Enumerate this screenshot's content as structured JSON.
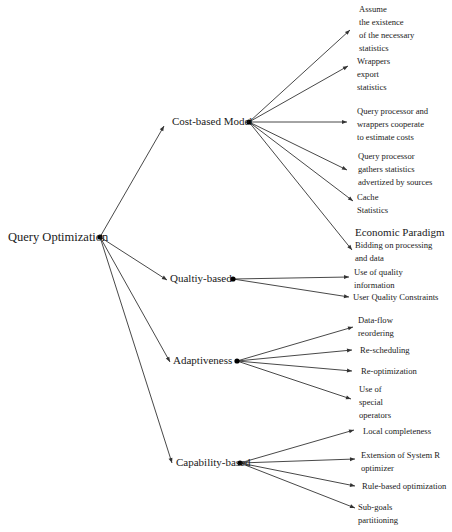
{
  "diagram": {
    "type": "tree",
    "root": {
      "label": "Query Optimization",
      "dot": [
        100,
        237
      ],
      "label_pos": [
        8,
        231
      ]
    },
    "branches": [
      {
        "id": "cost",
        "label": "Cost-based Model",
        "label_pos": [
          172,
          116
        ],
        "arrow_end": [
          164,
          126
        ],
        "dot": [
          249,
          122
        ],
        "leaves": [
          {
            "lines": [
              "Assume",
              "the existence",
              "of the necessary",
              "statistics"
            ],
            "pos": [
              359,
              3
            ],
            "arrow_end": [
              350,
              30
            ]
          },
          {
            "lines": [
              "Wrappers",
              "export",
              "statistics"
            ],
            "pos": [
              357,
              55
            ],
            "arrow_end": [
              348,
              66
            ]
          },
          {
            "lines": [
              "Query processor and",
              "wrappers cooperate",
              "to estimate costs"
            ],
            "pos": [
              357,
              105
            ],
            "arrow_end": [
              347,
              122
            ]
          },
          {
            "lines": [
              "Query processor",
              "gathers statistics",
              "advertized by sources"
            ],
            "pos": [
              358,
              150
            ],
            "arrow_end": [
              347,
              170
            ]
          },
          {
            "lines": [
              "Cache",
              "Statistics"
            ],
            "pos": [
              357,
              191
            ],
            "arrow_end": [
              353,
              201
            ]
          },
          {
            "lines": [
              "Economic Paradigm",
              "Bidding on  processing",
              "and data"
            ],
            "pos": [
              355,
              226
            ],
            "arrow_end": [
              352,
              250
            ],
            "emphasis_first_line": true
          }
        ]
      },
      {
        "id": "quality",
        "label": "Qualtiy-based",
        "label_pos": [
          170,
          273
        ],
        "arrow_end": [
          167,
          280
        ],
        "dot": [
          233,
          279
        ],
        "leaves": [
          {
            "lines": [
              "Use of quality",
              "information"
            ],
            "pos": [
              354,
              266
            ],
            "arrow_end": [
              349,
              277
            ]
          },
          {
            "lines": [
              "User Quality Constraints"
            ],
            "pos": [
              353,
              291
            ],
            "arrow_end": [
              349,
              297
            ]
          }
        ]
      },
      {
        "id": "adaptive",
        "label": "Adaptiveness",
        "label_pos": [
          173,
          355
        ],
        "arrow_end": [
          170,
          362
        ],
        "dot": [
          237,
          361
        ],
        "leaves": [
          {
            "lines": [
              "Data-flow",
              "reordering"
            ],
            "pos": [
              358,
              314
            ],
            "arrow_end": [
              353,
              327
            ]
          },
          {
            "lines": [
              "Re-scheduling"
            ],
            "pos": [
              360,
              344
            ],
            "arrow_end": [
              352,
              350
            ]
          },
          {
            "lines": [
              "Re-optimization"
            ],
            "pos": [
              361,
              365
            ],
            "arrow_end": [
              352,
              371
            ]
          },
          {
            "lines": [
              "Use of",
              "special",
              "operators"
            ],
            "pos": [
              359,
              383
            ],
            "arrow_end": [
              351,
              399
            ]
          }
        ]
      },
      {
        "id": "capability",
        "label": "Capability-based",
        "label_pos": [
          176,
          457
        ],
        "arrow_end": [
          172,
          463
        ],
        "dot": [
          240,
          463
        ],
        "leaves": [
          {
            "lines": [
              "Local completeness"
            ],
            "pos": [
              363,
              425
            ],
            "arrow_end": [
              354,
              430
            ]
          },
          {
            "lines": [
              "Extension of System R",
              "optimizer"
            ],
            "pos": [
              361,
              449
            ],
            "arrow_end": [
              355,
              459
            ]
          },
          {
            "lines": [
              "Rule-based optimization"
            ],
            "pos": [
              362,
              480
            ],
            "arrow_end": [
              355,
              486
            ]
          },
          {
            "lines": [
              "Sub-goals",
              "partitioning"
            ],
            "pos": [
              358,
              501
            ],
            "arrow_end": [
              355,
              508
            ]
          }
        ]
      }
    ]
  },
  "colors": {
    "background": "#ffffff",
    "line": "#333333",
    "text": "#1a1a1a",
    "dot": "#000000"
  }
}
